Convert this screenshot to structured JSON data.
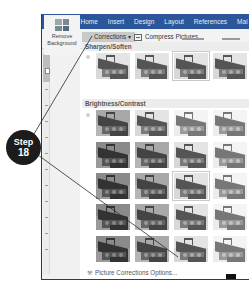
{
  "ribbon": {
    "tabs": [
      "File",
      "Home",
      "Insert",
      "Design",
      "Layout",
      "References",
      "Mai"
    ],
    "remove_background_label_1": "Remove",
    "remove_background_label_2": "Background",
    "corrections_label": "Corrections ▾",
    "compress_label": "Compress Pictures"
  },
  "corrections_dropdown": {
    "sections": [
      {
        "title": "Sharpen/Soften",
        "rows": 1,
        "columns": 4,
        "selected": [
          0,
          2
        ]
      },
      {
        "title": "Brightness/Contrast",
        "rows": 5,
        "columns": 4,
        "selected": [
          2,
          2
        ]
      }
    ],
    "options_label": "Picture Corrections Options...",
    "options_icon": "picture-corrections-icon"
  },
  "callout": {
    "line1": "Step",
    "line2": "18",
    "color": "#1c1c1c"
  },
  "colors": {
    "tab_bar": "#2b579a",
    "ribbon_bg": "#f3f3f3",
    "corrections_button_bg": "#c9c9c9",
    "section_header_bg": "#ececec"
  }
}
